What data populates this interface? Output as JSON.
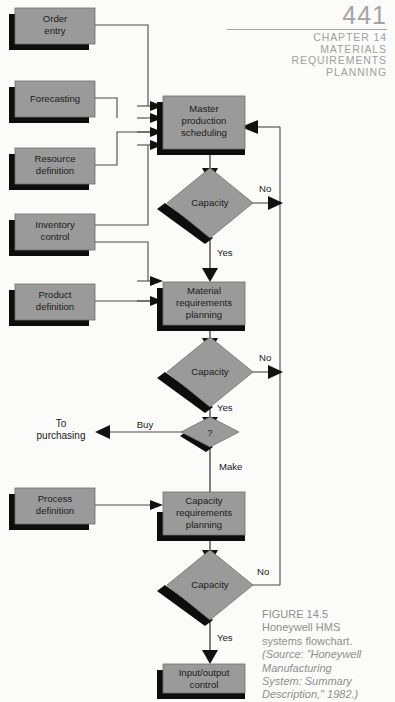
{
  "header": {
    "folio": "441",
    "running_head_lines": [
      "CHAPTER 14",
      "MATERIALS",
      "REQUIREMENTS",
      "PLANNING"
    ]
  },
  "caption": {
    "figure_number": "FIGURE 14.5",
    "title_line_1": "Honeywell HMS",
    "title_line_2": "systems flowchart.",
    "source_line_1": "(Source: \"Honeywell",
    "source_line_2": "Manufacturing",
    "source_line_3": "System: Summary",
    "source_line_4": "Description,\" 1982.)"
  },
  "colors": {
    "shape_fill": "#9a9a9a",
    "shape_shadow": "#0d0d0d",
    "shape_stroke": "#6f6f6f",
    "connector": "#4a4a4a",
    "page_background": "#fbfbf9",
    "header_gray": "#a0a0a0",
    "caption_gray": "#8f8f8f"
  },
  "flowchart": {
    "type": "flowchart",
    "input_boxes": [
      {
        "id": "order-entry",
        "lines": [
          "Order",
          "entry"
        ]
      },
      {
        "id": "forecasting",
        "lines": [
          "Forecasting"
        ]
      },
      {
        "id": "resource-definition",
        "lines": [
          "Resource",
          "definition"
        ]
      },
      {
        "id": "inventory-control",
        "lines": [
          "Inventory",
          "control"
        ]
      },
      {
        "id": "product-definition",
        "lines": [
          "Product",
          "definition"
        ]
      },
      {
        "id": "process-definition",
        "lines": [
          "Process",
          "definition"
        ]
      }
    ],
    "process_boxes": [
      {
        "id": "master-production-scheduling",
        "lines": [
          "Master",
          "production",
          "scheduling"
        ]
      },
      {
        "id": "material-requirements-planning",
        "lines": [
          "Material",
          "requirements",
          "planning"
        ]
      },
      {
        "id": "capacity-requirements-planning",
        "lines": [
          "Capacity",
          "requirements",
          "planning"
        ]
      },
      {
        "id": "input-output-control",
        "lines": [
          "Input/output",
          "control"
        ]
      }
    ],
    "decisions": [
      {
        "id": "capacity-1",
        "label": "Capacity"
      },
      {
        "id": "capacity-2",
        "label": "Capacity"
      },
      {
        "id": "make-or-buy",
        "label": "?"
      },
      {
        "id": "capacity-3",
        "label": "Capacity"
      }
    ],
    "edge_labels": {
      "no_1": "No",
      "yes_1": "Yes",
      "no_2": "No",
      "yes_2": "Yes",
      "buy": "Buy",
      "make": "Make",
      "no_3": "No",
      "yes_3": "Yes"
    },
    "offpage": {
      "to_purchasing_line_1": "To",
      "to_purchasing_line_2": "purchasing"
    }
  }
}
